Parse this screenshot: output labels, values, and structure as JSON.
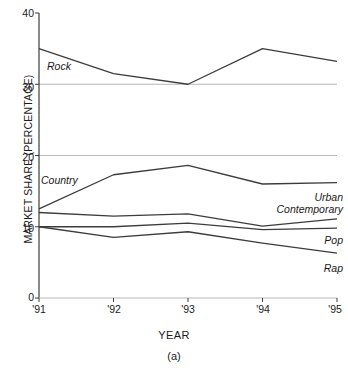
{
  "figure": {
    "caption": "(a)",
    "xlabel": "YEAR",
    "ylabel": "MARKET SHARE (PERCENTAGE)"
  },
  "axis": {
    "y_ticks": [
      "0",
      "10",
      "20",
      "30",
      "40"
    ],
    "x_ticks": [
      "'91",
      "'92",
      "'93",
      "'94",
      "'95"
    ],
    "gridlines": [
      20,
      30
    ],
    "line_color": "#3c3c3c",
    "grid_color": "#b8b8b8"
  },
  "labels": {
    "rock": "Rock",
    "country": "Country",
    "urban": "Urban",
    "contemporary": "Contemporary",
    "pop": "Pop",
    "rap": "Rap"
  },
  "chart_data": {
    "type": "line",
    "title": "",
    "xlabel": "YEAR",
    "ylabel": "MARKET SHARE (PERCENTAGE)",
    "categories": [
      "'91",
      "'92",
      "'93",
      "'94",
      "'95"
    ],
    "x": [
      1991,
      1992,
      1993,
      1994,
      1995
    ],
    "xlim": [
      1991,
      1995
    ],
    "ylim": [
      0,
      40
    ],
    "yticks": [
      0,
      10,
      20,
      30,
      40
    ],
    "grid": "horizontal gridlines at 20 and 30 only",
    "legend": "inline series labels (no legend box)",
    "series": [
      {
        "name": "Rock",
        "values": [
          35.0,
          31.5,
          30.0,
          35.0,
          33.2
        ]
      },
      {
        "name": "Country",
        "values": [
          12.5,
          17.3,
          18.6,
          16.0,
          16.2
        ]
      },
      {
        "name": "Urban Contemporary",
        "values": [
          12.0,
          11.5,
          11.8,
          10.1,
          11.1
        ]
      },
      {
        "name": "Pop",
        "values": [
          10.0,
          10.0,
          10.5,
          9.6,
          9.8
        ]
      },
      {
        "name": "Rap",
        "values": [
          10.0,
          8.5,
          9.3,
          7.7,
          6.3
        ]
      }
    ]
  }
}
